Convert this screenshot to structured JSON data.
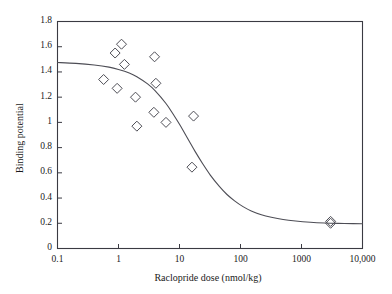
{
  "chart_data": {
    "type": "scatter",
    "title": "",
    "xlabel": "Raclopride dose (nmol/kg)",
    "ylabel": "Binding potential",
    "xscale": "log",
    "yscale": "linear",
    "xlim": [
      0.1,
      10000
    ],
    "ylim": [
      0,
      1.8
    ],
    "grid": false,
    "legend": null,
    "xticks": [
      0.1,
      1,
      10,
      100,
      1000,
      10000
    ],
    "xticklabels": [
      "0.1",
      "1",
      "10",
      "100",
      "1000",
      "10,000"
    ],
    "yticks": [
      0,
      0.2,
      0.4,
      0.6,
      0.8,
      1,
      1.2,
      1.4,
      1.6,
      1.8
    ],
    "yticklabels": [
      "0",
      "0.2",
      "0.4",
      "0.6",
      "0.8",
      "1",
      "1.2",
      "1.4",
      "1.6",
      "1.8"
    ],
    "marker": "open-diamond",
    "marker_color": "#4d4d55",
    "line_color": "#4d4d55",
    "series": [
      {
        "name": "Observed binding potential",
        "points": [
          {
            "x": 0.57,
            "y": 1.34
          },
          {
            "x": 0.88,
            "y": 1.55
          },
          {
            "x": 1.12,
            "y": 1.62
          },
          {
            "x": 0.95,
            "y": 1.27
          },
          {
            "x": 1.25,
            "y": 1.46
          },
          {
            "x": 1.9,
            "y": 1.2
          },
          {
            "x": 2.0,
            "y": 0.97
          },
          {
            "x": 3.9,
            "y": 1.52
          },
          {
            "x": 4.1,
            "y": 1.31
          },
          {
            "x": 3.8,
            "y": 1.08
          },
          {
            "x": 6.0,
            "y": 1.0
          },
          {
            "x": 17.0,
            "y": 1.05
          },
          {
            "x": 16.0,
            "y": 0.645
          },
          {
            "x": 3000,
            "y": 0.215
          },
          {
            "x": 3000,
            "y": 0.2
          }
        ]
      }
    ],
    "fit_curve": {
      "name": "Sigmoid fit",
      "model": "Emax inhibition",
      "e0": 1.48,
      "emin": 0.195,
      "ic50": 18,
      "hill": 1.15,
      "points": [
        {
          "x": 0.1,
          "y": 1.475
        },
        {
          "x": 0.2,
          "y": 1.468
        },
        {
          "x": 0.4,
          "y": 1.455
        },
        {
          "x": 0.7,
          "y": 1.438
        },
        {
          "x": 1.0,
          "y": 1.42
        },
        {
          "x": 1.5,
          "y": 1.392
        },
        {
          "x": 2.0,
          "y": 1.362
        },
        {
          "x": 3.0,
          "y": 1.305
        },
        {
          "x": 4.0,
          "y": 1.25
        },
        {
          "x": 6.0,
          "y": 1.15
        },
        {
          "x": 8.0,
          "y": 1.06
        },
        {
          "x": 10.0,
          "y": 0.985
        },
        {
          "x": 14.0,
          "y": 0.862
        },
        {
          "x": 18.0,
          "y": 0.77
        },
        {
          "x": 24.0,
          "y": 0.672
        },
        {
          "x": 32.0,
          "y": 0.582
        },
        {
          "x": 45.0,
          "y": 0.492
        },
        {
          "x": 60.0,
          "y": 0.428
        },
        {
          "x": 80.0,
          "y": 0.378
        },
        {
          "x": 110.0,
          "y": 0.332
        },
        {
          "x": 150.0,
          "y": 0.298
        },
        {
          "x": 220.0,
          "y": 0.268
        },
        {
          "x": 320.0,
          "y": 0.248
        },
        {
          "x": 500.0,
          "y": 0.23
        },
        {
          "x": 800.0,
          "y": 0.218
        },
        {
          "x": 1400.0,
          "y": 0.208
        },
        {
          "x": 2400.0,
          "y": 0.202
        },
        {
          "x": 4000.0,
          "y": 0.199
        },
        {
          "x": 7000.0,
          "y": 0.197
        },
        {
          "x": 10000,
          "y": 0.196
        }
      ]
    }
  },
  "axes": {
    "frame_color": "#3a3a42",
    "background": "#ffffff"
  }
}
